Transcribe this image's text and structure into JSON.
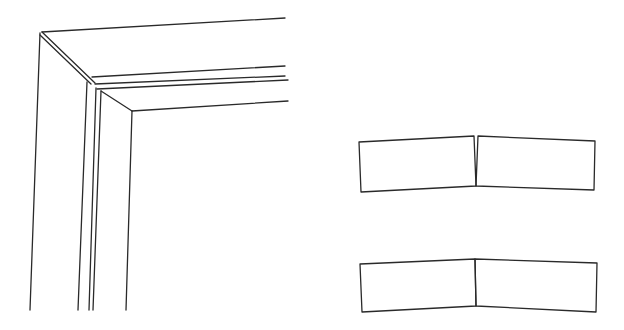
{
  "figure": {
    "stroke_color": "#2a2a2a",
    "background": "#ffffff",
    "frame_corner": {
      "description": "Perspective view of a mitered frame / door casing corner",
      "lines": [
        {
          "id": "outer-top",
          "x1": 42,
          "y1": 32,
          "x2": 285,
          "y2": 18
        },
        {
          "id": "outer-left",
          "x1": 40,
          "y1": 33,
          "x2": 30,
          "y2": 310
        },
        {
          "id": "miter-a",
          "x1": 42,
          "y1": 32,
          "x2": 95,
          "y2": 83
        },
        {
          "id": "miter-b",
          "x1": 40,
          "y1": 35,
          "x2": 91,
          "y2": 84
        },
        {
          "id": "rail-1",
          "x1": 92,
          "y1": 77,
          "x2": 285,
          "y2": 66
        },
        {
          "id": "rail-2",
          "x1": 95,
          "y1": 84,
          "x2": 285,
          "y2": 76
        },
        {
          "id": "rail-3",
          "x1": 97,
          "y1": 89,
          "x2": 288,
          "y2": 80
        },
        {
          "id": "inner-top",
          "x1": 132,
          "y1": 111,
          "x2": 288,
          "y2": 101
        },
        {
          "id": "inner-miter",
          "x1": 101,
          "y1": 91,
          "x2": 132,
          "y2": 111
        },
        {
          "id": "stile-1",
          "x1": 87,
          "y1": 82,
          "x2": 78,
          "y2": 310
        },
        {
          "id": "stile-2",
          "x1": 96,
          "y1": 88,
          "x2": 89,
          "y2": 310
        },
        {
          "id": "stile-3",
          "x1": 101,
          "y1": 91,
          "x2": 93,
          "y2": 310
        },
        {
          "id": "inner-left",
          "x1": 132,
          "y1": 111,
          "x2": 126,
          "y2": 310
        }
      ]
    },
    "joint_open": {
      "description": "Two blocks meeting at an angle with an open gap at the top",
      "left_block": [
        [
          359,
          142
        ],
        [
          474,
          136
        ],
        [
          476,
          186
        ],
        [
          361,
          192
        ]
      ],
      "right_block": [
        [
          478,
          136
        ],
        [
          595,
          141
        ],
        [
          594,
          190
        ],
        [
          476,
          186
        ]
      ]
    },
    "joint_closed": {
      "description": "Two blocks meeting at an angle with a tight joint",
      "left_block": [
        [
          360,
          264
        ],
        [
          475,
          259
        ],
        [
          476,
          306
        ],
        [
          362,
          312
        ]
      ],
      "right_block": [
        [
          475,
          259
        ],
        [
          597,
          263
        ],
        [
          596,
          312
        ],
        [
          476,
          306
        ]
      ]
    }
  }
}
